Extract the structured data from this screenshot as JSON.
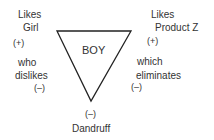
{
  "diagram": {
    "center": "BOY",
    "top_left": {
      "line1": "Likes",
      "line2": "Girl",
      "sign": "(+)"
    },
    "top_right": {
      "line1": "Likes",
      "line2": "Product Z",
      "sign": "(+)"
    },
    "left_side": {
      "line1": "who",
      "line2": "dislikes",
      "sign": "(–)"
    },
    "right_side": {
      "line1": "which",
      "line2": "eliminates",
      "sign": "(–)"
    },
    "bottom": {
      "sign": "(–)",
      "label": "Dandruff"
    }
  }
}
